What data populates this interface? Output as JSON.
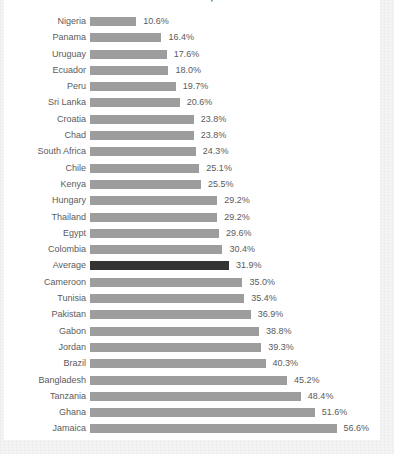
{
  "card": {
    "background_color": "#ffffff",
    "page_background_color": "#f4f4f4"
  },
  "chart_title_clipped": "Revenues in Selected Countries, 2013",
  "colors": {
    "bar": "#9d9d9d",
    "highlight_bar": "#333333",
    "label_text": "#5b5b5b",
    "title_text": "#3a3a3a"
  },
  "chart_data": {
    "type": "bar",
    "orientation": "horizontal",
    "title": "Revenues in Selected Countries, 2013",
    "subtitle": "",
    "xlabel": "",
    "ylabel": "",
    "grid": false,
    "legend": null,
    "xlim": [
      0,
      58.3
    ],
    "value_suffix": "%",
    "sort_order": "ascending",
    "highlight_category": "Average",
    "categories": [
      "Nigeria",
      "Panama",
      "Uruguay",
      "Ecuador",
      "Peru",
      "Sri Lanka",
      "Croatia",
      "Chad",
      "South Africa",
      "Chile",
      "Kenya",
      "Hungary",
      "Thailand",
      "Egypt",
      "Colombia",
      "Average",
      "Cameroon",
      "Tunisia",
      "Pakistan",
      "Gabon",
      "Jordan",
      "Brazil",
      "Bangladesh",
      "Tanzania",
      "Ghana",
      "Jamaica",
      "Turkey"
    ],
    "values": [
      10.6,
      16.4,
      17.6,
      18.0,
      19.7,
      20.6,
      23.8,
      23.8,
      24.3,
      25.1,
      25.5,
      29.2,
      29.2,
      29.6,
      30.4,
      31.9,
      35.0,
      35.4,
      36.9,
      38.8,
      39.3,
      40.3,
      45.2,
      48.4,
      51.6,
      56.6,
      58.3
    ],
    "value_labels": [
      "10.6%",
      "16.4%",
      "17.6%",
      "18.0%",
      "19.7%",
      "20.6%",
      "23.8%",
      "23.8%",
      "24.3%",
      "25.1%",
      "25.5%",
      "29.2%",
      "29.2%",
      "29.6%",
      "30.4%",
      "31.9%",
      "35.0%",
      "35.4%",
      "36.9%",
      "38.8%",
      "39.3%",
      "40.3%",
      "45.2%",
      "48.4%",
      "51.6%",
      "56.6%",
      "58.3%"
    ]
  }
}
